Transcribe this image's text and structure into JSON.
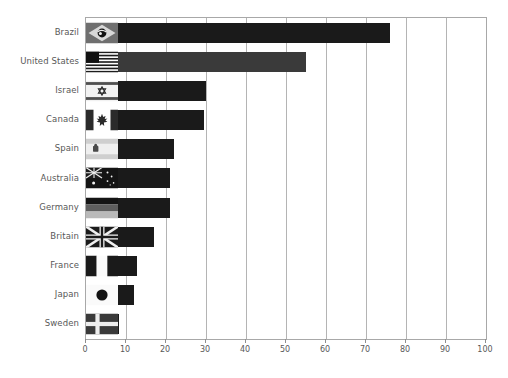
{
  "chart_data": {
    "type": "bar",
    "orientation": "horizontal",
    "title": "",
    "subtitle": "",
    "xlabel": "",
    "ylabel": "",
    "xlim": [
      0,
      100
    ],
    "ylim": null,
    "grid": true,
    "legend": null,
    "xticks": [
      "0",
      "10",
      "20",
      "30",
      "40",
      "50",
      "60",
      "70",
      "80",
      "90",
      "100"
    ],
    "xtick_values": [
      0,
      10,
      20,
      30,
      40,
      50,
      60,
      70,
      80,
      90,
      100
    ],
    "categories": [
      "Brazil",
      "United States",
      "Israel",
      "Canada",
      "Spain",
      "Australia",
      "Germany",
      "Britain",
      "France",
      "Japan",
      "Sweden"
    ],
    "values": [
      76,
      55,
      30,
      29.5,
      22,
      21,
      21,
      17,
      12.8,
      12,
      8.2
    ],
    "bar_colors": [
      "#1a1a1a",
      "#3a3a3a",
      "#1a1a1a",
      "#1a1a1a",
      "#1a1a1a",
      "#1a1a1a",
      "#1a1a1a",
      "#1a1a1a",
      "#1a1a1a",
      "#1a1a1a",
      "#1a1a1a"
    ],
    "flags": [
      "brazil-flag",
      "united-states-flag",
      "israel-flag",
      "canada-flag",
      "spain-flag",
      "australia-flag",
      "germany-flag",
      "britain-flag",
      "france-flag",
      "japan-flag",
      "sweden-flag"
    ]
  },
  "axes": {
    "frame_color": "#a8a8a8",
    "grid_color": "#b4b4b4",
    "tick_label_color": "#585858",
    "category_label_color": "#585858"
  }
}
